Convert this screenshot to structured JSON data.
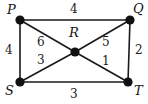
{
  "figure": {
    "name": "weighted-graph-diagram",
    "width": 148,
    "height": 104,
    "background_color": "#ffffff",
    "stroke_color": "#1a1a1a",
    "vertex_fill_color": "#111111"
  },
  "graph": {
    "type": "undirected-weighted-graph",
    "vertices": [
      {
        "id": "P",
        "label": "P",
        "x": 20,
        "y": 20,
        "label_x": 7,
        "label_y": 3
      },
      {
        "id": "Q",
        "label": "Q",
        "x": 130,
        "y": 20,
        "label_x": 133,
        "label_y": 2
      },
      {
        "id": "R",
        "label": "R",
        "x": 75,
        "y": 52,
        "label_x": 69,
        "label_y": 26
      },
      {
        "id": "S",
        "label": "S",
        "x": 20,
        "y": 82,
        "label_x": 5,
        "label_y": 84
      },
      {
        "id": "T",
        "label": "T",
        "x": 128,
        "y": 82,
        "label_x": 134,
        "label_y": 84
      }
    ],
    "edges": [
      {
        "from": "P",
        "to": "Q",
        "weight": "4",
        "label_x": 70,
        "label_y": 3
      },
      {
        "from": "P",
        "to": "S",
        "weight": "4",
        "label_x": 5,
        "label_y": 44
      },
      {
        "from": "Q",
        "to": "T",
        "weight": "2",
        "label_x": 135,
        "label_y": 44
      },
      {
        "from": "S",
        "to": "T",
        "weight": "3",
        "label_x": 70,
        "label_y": 88
      },
      {
        "from": "P",
        "to": "R",
        "weight": "6",
        "label_x": 37,
        "label_y": 36
      },
      {
        "from": "S",
        "to": "R",
        "weight": "3",
        "label_x": 37,
        "label_y": 54
      },
      {
        "from": "Q",
        "to": "R",
        "weight": "5",
        "label_x": 102,
        "label_y": 36
      },
      {
        "from": "T",
        "to": "R",
        "weight": "1",
        "label_x": 102,
        "label_y": 55
      }
    ]
  }
}
